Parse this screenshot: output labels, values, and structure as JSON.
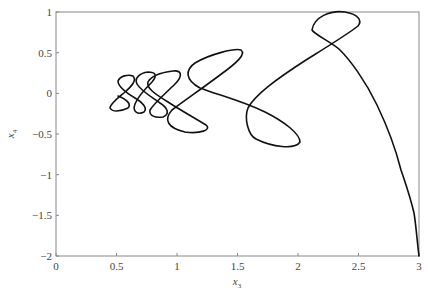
{
  "chart_data": {
    "type": "line",
    "title": "",
    "xlabel": "x3",
    "ylabel": "x4",
    "xlabel_main": "x",
    "xlabel_sub": "3",
    "ylabel_main": "x",
    "ylabel_sub": "4",
    "xlim": [
      0,
      3
    ],
    "ylim": [
      -2,
      1
    ],
    "grid": false,
    "legend": null,
    "x_ticks": [
      "0",
      "0.5",
      "1",
      "1.5",
      "2",
      "2.5",
      "3"
    ],
    "y_ticks": [
      "1",
      "0.5",
      "0",
      "-0.5",
      "-1",
      "-1.5",
      "-2"
    ],
    "colors": {
      "line": "#111111",
      "axis": "#888888"
    },
    "series": [
      {
        "name": "trajectory (x3, x4)",
        "description": "Phase-plane trajectory starting near (3, -2), rising to a loop near (2.55, 0.7), crossing down to a loop near (2.0, -0.65), then spiralling into successively smaller loops to the left, ending near (0.45, 0.0)",
        "points": [
          [
            3.0,
            -2.0
          ],
          [
            2.98,
            -1.8
          ],
          [
            2.95,
            -1.6
          ],
          [
            2.93,
            -1.4
          ],
          [
            2.89,
            -1.2
          ],
          [
            2.82,
            -0.95
          ],
          [
            2.7,
            -0.6
          ],
          [
            2.55,
            -0.25
          ],
          [
            2.42,
            0.1
          ],
          [
            2.3,
            0.38
          ],
          [
            2.2,
            0.55
          ],
          [
            2.2,
            0.7
          ],
          [
            2.3,
            0.8
          ],
          [
            2.45,
            0.82
          ],
          [
            2.55,
            0.75
          ],
          [
            2.45,
            0.6
          ],
          [
            2.3,
            0.45
          ],
          [
            2.0,
            0.2
          ],
          [
            1.75,
            0.0
          ],
          [
            1.6,
            -0.25
          ],
          [
            1.62,
            -0.55
          ],
          [
            1.8,
            -0.7
          ],
          [
            1.97,
            -0.72
          ],
          [
            1.98,
            -0.6
          ],
          [
            1.8,
            -0.4
          ],
          [
            1.55,
            -0.2
          ],
          [
            1.3,
            0.0
          ],
          [
            1.1,
            0.2
          ],
          [
            1.05,
            0.35
          ],
          [
            1.2,
            0.5
          ],
          [
            1.4,
            0.55
          ],
          [
            1.48,
            0.5
          ],
          [
            1.35,
            0.3
          ],
          [
            1.1,
            0.0
          ],
          [
            0.9,
            -0.2
          ],
          [
            0.95,
            -0.4
          ],
          [
            1.15,
            -0.45
          ],
          [
            1.25,
            -0.4
          ],
          [
            1.1,
            -0.25
          ],
          [
            0.9,
            -0.05
          ],
          [
            0.75,
            0.15
          ],
          [
            0.8,
            0.28
          ],
          [
            1.0,
            0.28
          ],
          [
            1.05,
            0.2
          ],
          [
            0.9,
            0.0
          ],
          [
            0.75,
            -0.2
          ],
          [
            0.8,
            -0.3
          ],
          [
            0.9,
            -0.28
          ],
          [
            0.8,
            -0.1
          ],
          [
            0.65,
            0.1
          ],
          [
            0.65,
            0.25
          ],
          [
            0.8,
            0.28
          ],
          [
            0.8,
            0.15
          ],
          [
            0.65,
            -0.05
          ],
          [
            0.6,
            -0.2
          ],
          [
            0.7,
            -0.3
          ],
          [
            0.7,
            -0.2
          ],
          [
            0.55,
            0.0
          ],
          [
            0.5,
            0.15
          ],
          [
            0.6,
            0.22
          ],
          [
            0.65,
            0.15
          ],
          [
            0.55,
            0.0
          ],
          [
            0.45,
            -0.1
          ],
          [
            0.5,
            -0.18
          ],
          [
            0.6,
            -0.15
          ],
          [
            0.5,
            0.0
          ]
        ]
      }
    ]
  }
}
